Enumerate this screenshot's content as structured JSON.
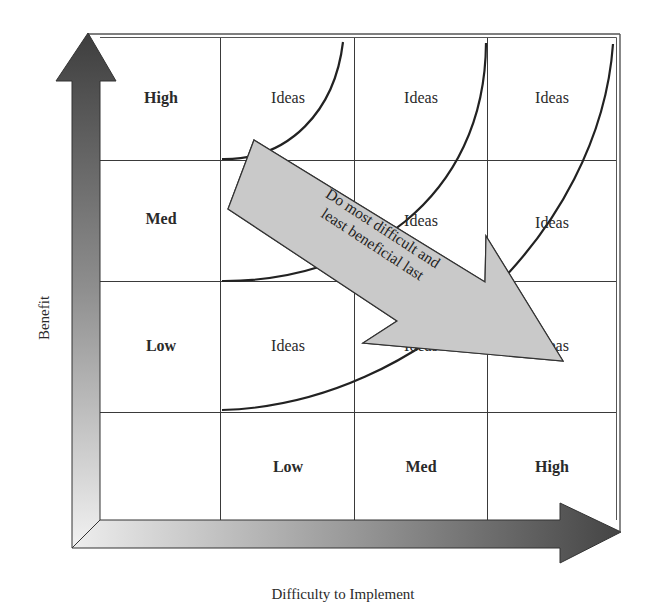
{
  "diagram": {
    "type": "prioritization-matrix",
    "axes": {
      "y_label": "Benefit",
      "x_label": "Difficulty to Implement"
    },
    "row_headers": [
      "High",
      "Med",
      "Low"
    ],
    "column_headers": [
      "Low",
      "Med",
      "High"
    ],
    "cells": [
      [
        "Ideas",
        "Ideas",
        "Ideas"
      ],
      [
        "Ideas",
        "Ideas",
        "Ideas"
      ],
      [
        "Ideas",
        "Ideas",
        "Ideas"
      ]
    ],
    "callout": {
      "line1": "Do most difficult and",
      "line2": "least beneficial last"
    },
    "colors": {
      "grid_line": "#3a3a3a",
      "arrow_dark": "#4a4a4a",
      "arrow_light": "#e8e8e8",
      "callout_fill": "#c9c9c9",
      "curve": "#222222"
    }
  }
}
